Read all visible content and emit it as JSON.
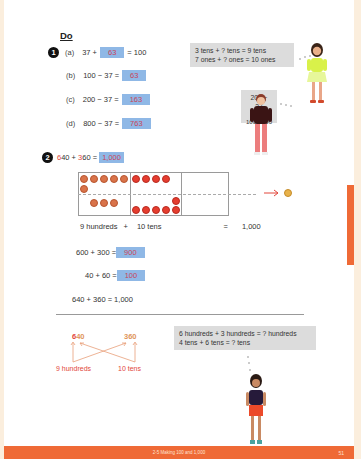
{
  "section": {
    "heading": "Do"
  },
  "q1": {
    "number": "1",
    "items": [
      {
        "label": "(a)",
        "pre": "37 + ",
        "answer": "63",
        "post": " = 100"
      },
      {
        "label": "(b)",
        "pre": "100 − 37 = ",
        "answer": "63",
        "post": ""
      },
      {
        "label": "(c)",
        "pre": "200 − 37 = ",
        "answer": "163",
        "post": ""
      },
      {
        "label": "(d)",
        "pre": "800 − 37 = ",
        "answer": "763",
        "post": ""
      }
    ],
    "hint_bubble": {
      "line1": "3 tens + ? tens = 9 tens",
      "line2": "7 ones + ? ones = 10 ones"
    },
    "split_bubble": {
      "top": "200 − 37",
      "left": "100",
      "right": "100"
    }
  },
  "q2": {
    "number": "2",
    "eq": {
      "a_first": "6",
      "a_rest": "40",
      "plus": " + ",
      "b_first": "3",
      "b_rest": "60",
      "equals": " = ",
      "answer": "1,000"
    },
    "disc_table": {
      "columns": [
        "hundreds",
        "tens",
        "ones"
      ],
      "row1": {
        "hundreds": 6,
        "tens": 4,
        "ones": 0
      },
      "row2": {
        "hundreds": 3,
        "tens": 6,
        "ones": 0
      },
      "hundred_label": "100",
      "ten_label": "10",
      "thousand_label": "1000"
    },
    "summary": {
      "left": "9 hundreds",
      "plus": "+",
      "mid": "10 tens",
      "equals": "=",
      "result": "1,000"
    },
    "step1": {
      "pre": "600 + 300 = ",
      "answer": "900"
    },
    "step2": {
      "pre": "40 + 60 = ",
      "answer": "100"
    },
    "final": "640 + 360 = 1,000",
    "diagram": {
      "left_num_red": "6",
      "left_num_rest": "40",
      "right_num_red": "3",
      "right_num_rest": "60",
      "left_label": "9 hundreds",
      "right_label": "10 tens"
    },
    "hint_bubble": {
      "line1": "6 hundreds + 3 hundreds = ? hundreds",
      "line2": "4 tens + 6 tens = ? tens"
    }
  },
  "footer": {
    "title": "2-5  Making 100 and 1,000",
    "page_number": "51"
  },
  "colors": {
    "accent_orange": "#ef6a36",
    "answer_box": "#8fb8e6",
    "answer_text": "#c8465a",
    "highlight_red": "#e2463b",
    "margin_cream": "#fbeedd"
  }
}
